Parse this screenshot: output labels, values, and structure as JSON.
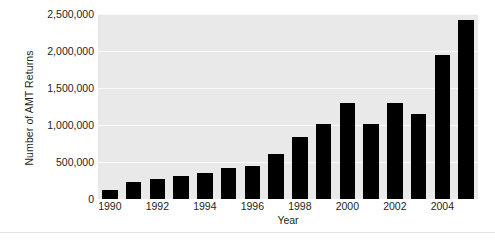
{
  "chart_data": {
    "type": "bar",
    "title": "",
    "xlabel": "Year",
    "ylabel": "Number of AMT Returns",
    "categories": [
      "1990",
      "1991",
      "1992",
      "1993",
      "1994",
      "1995",
      "1996",
      "1997",
      "1998",
      "1999",
      "2000",
      "2001",
      "2002",
      "2003",
      "2004",
      "2005"
    ],
    "values": [
      120000,
      230000,
      270000,
      310000,
      350000,
      420000,
      450000,
      610000,
      840000,
      1020000,
      1300000,
      1020000,
      1300000,
      1150000,
      1950000,
      2420000
    ],
    "ylim": [
      0,
      2500000
    ],
    "ytick_values": [
      0,
      500000,
      1000000,
      1500000,
      2000000,
      2500000
    ],
    "ytick_labels": [
      "0",
      "500,000",
      "1,000,000",
      "1,500,000",
      "2,000,000",
      "2,500,000"
    ],
    "xtick_labels": [
      "1990",
      "1992",
      "1994",
      "1996",
      "1998",
      "2000",
      "2002",
      "2004"
    ],
    "grid": true,
    "legend": "none",
    "bar_color": "#000000",
    "plot_background": "#e9e9e9",
    "gridline_color": "#fafafa",
    "text_color": "#231f20"
  }
}
